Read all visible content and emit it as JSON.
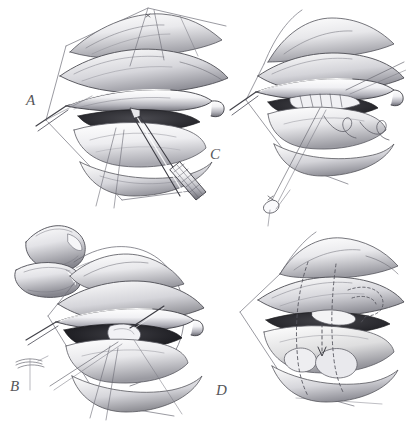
{
  "figure": {
    "medium": "pen-and-ink grayscale medical illustration",
    "background_color": "#ffffff",
    "ink_color": "#3a3a3e",
    "label_color": "#56565a",
    "width": 406,
    "height": 429
  },
  "panels": [
    {
      "id": "A",
      "label": "A",
      "position": "top-left",
      "caption_text": "A",
      "depicts": "Everted eyelid held by a lid retractor with traction sutures; serrated forceps grasping the tarsal tissue at the incision line",
      "elements": [
        "upper-eyelid",
        "lid-retractor",
        "traction-sutures",
        "serrated-forceps",
        "incision-margin"
      ]
    },
    {
      "id": "B",
      "label": "B",
      "position": "bottom-left",
      "caption_text": "B",
      "depicts": "Surgeon's thumb and index finger drawing a long curved suture through the eyelid under the retractor; small knot-tie detail inset at lower left",
      "elements": [
        "surgeon-thumb",
        "surgeon-index-finger",
        "curved-suture-loop",
        "lid-retractor",
        "knot-detail-inset",
        "incision-margin"
      ]
    },
    {
      "id": "C",
      "label": "C",
      "position": "top-right",
      "caption_text": "C",
      "depicts": "Placed sutures seen in the exposed tarsus with two free suture loops lying across the lid and a knotted suture tail descending below",
      "elements": [
        "lid-retractor",
        "placed-sutures",
        "suture-loops",
        "knotted-suture-tail",
        "exposed-tarsus"
      ]
    },
    {
      "id": "D",
      "label": "D",
      "position": "bottom-right",
      "caption_text": "D",
      "depicts": "Completed closure of the eyelid with dashed outlines marking the planned tissue advancement and a dashed arrow indicating the direction of movement",
      "elements": [
        "closed-eyelid",
        "dashed-planning-lines",
        "direction-arrow",
        "tissue-fold"
      ]
    }
  ]
}
